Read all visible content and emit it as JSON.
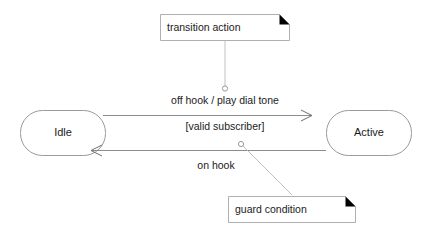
{
  "diagram": {
    "type": "uml-state-diagram",
    "background_color": "#ffffff",
    "states": [
      {
        "id": "idle",
        "label": "Idle"
      },
      {
        "id": "active",
        "label": "Active"
      }
    ],
    "transitions": [
      {
        "id": "idle-to-active",
        "from": "Idle",
        "to": "Active",
        "trigger_action": "off hook / play dial tone",
        "guard": "[valid subscriber]",
        "direction": "right"
      },
      {
        "id": "active-to-idle",
        "from": "Active",
        "to": "Idle",
        "trigger_action": "on hook",
        "direction": "left"
      }
    ],
    "notes": [
      {
        "id": "transition-action-note",
        "label": "transition action"
      },
      {
        "id": "guard-condition-note",
        "label": "guard condition"
      }
    ],
    "colors": {
      "state_stroke": "#9a9a9a",
      "edge_stroke": "#8c8c8c",
      "note_stroke": "#b0b0b0",
      "connector_stroke": "#c2c2c2",
      "text": "#1a1a1a",
      "fold": "#000000"
    }
  }
}
